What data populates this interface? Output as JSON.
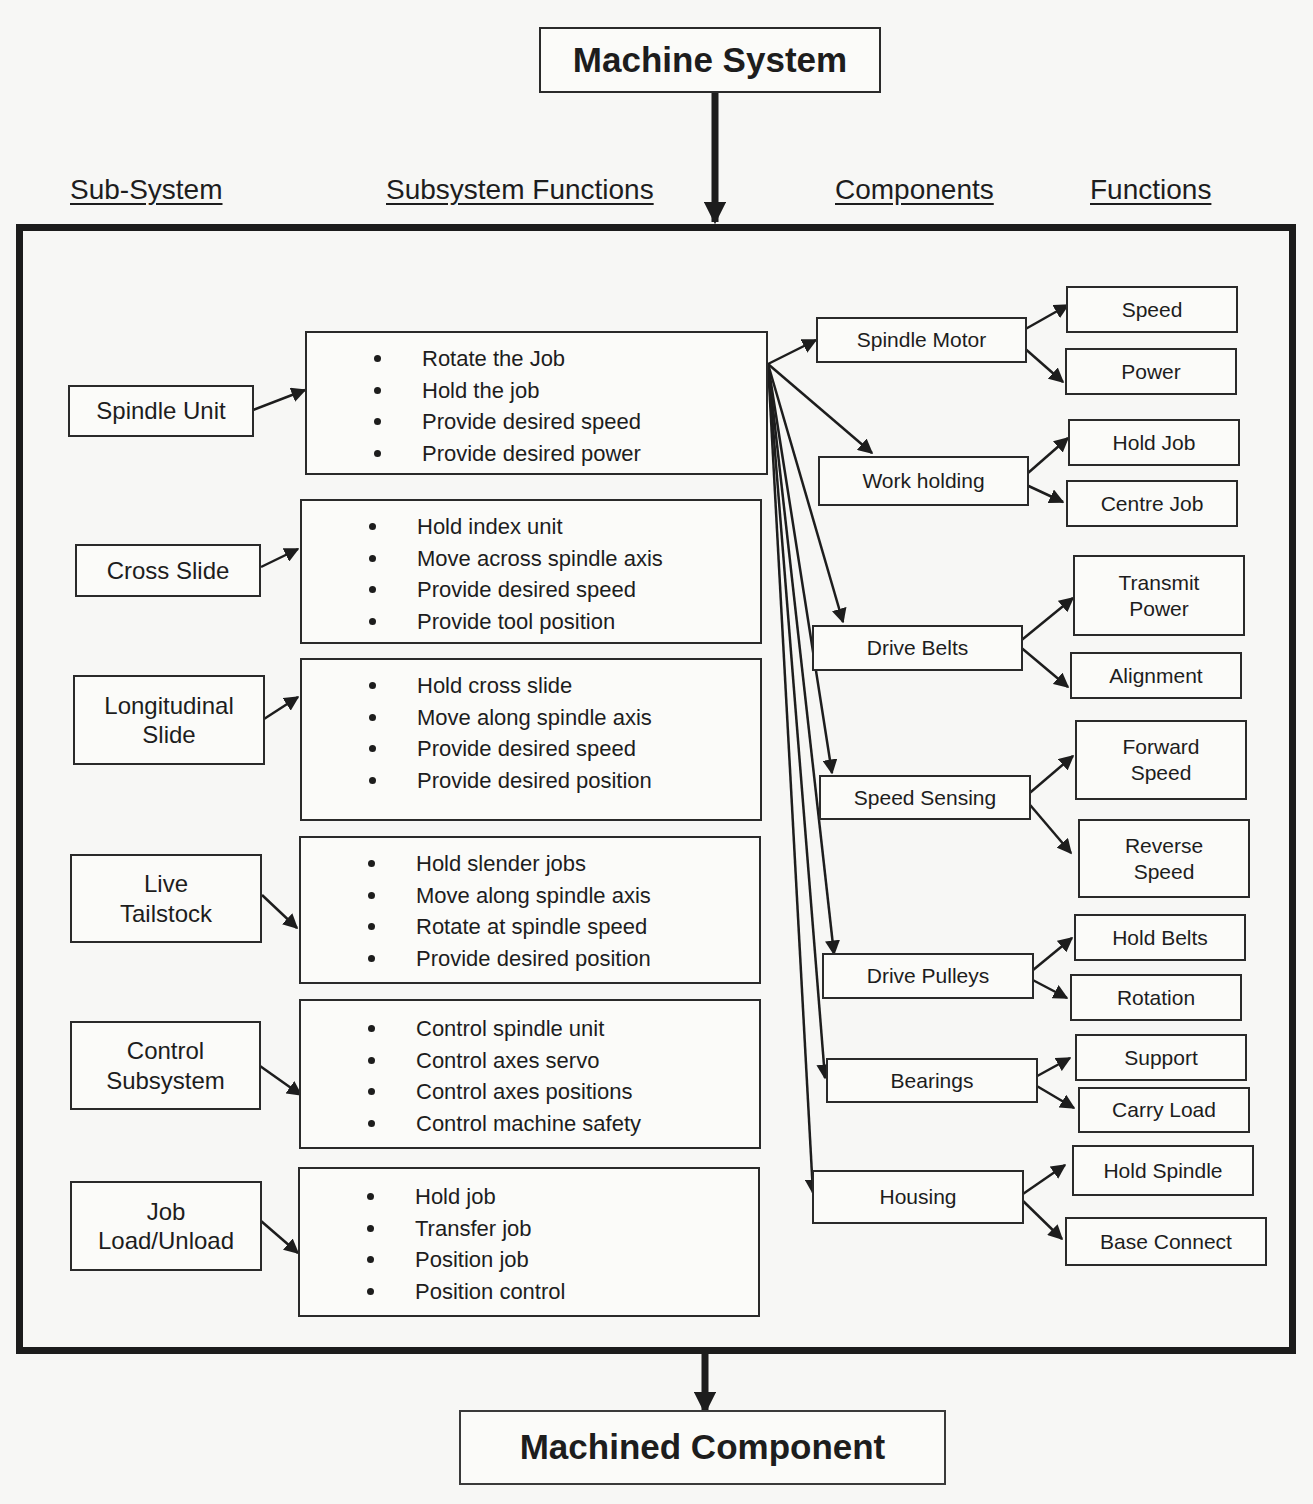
{
  "diagram": {
    "top": "Machine System",
    "bottom": "Machined Component",
    "headers": {
      "subsystem": "Sub-System",
      "subsystem_functions": "Subsystem Functions",
      "components": "Components",
      "functions": "Functions"
    },
    "subsystems": [
      {
        "label": "Spindle Unit",
        "functions": [
          "Rotate the Job",
          "Hold the job",
          "Provide desired speed",
          "Provide desired power"
        ]
      },
      {
        "label": "Cross Slide",
        "functions": [
          "Hold index unit",
          "Move across spindle axis",
          "Provide desired speed",
          "Provide tool position"
        ]
      },
      {
        "label": "Longitudinal Slide",
        "functions": [
          "Hold cross slide",
          "Move along spindle axis",
          "Provide desired speed",
          "Provide desired position"
        ]
      },
      {
        "label": "Live Tailstock",
        "functions": [
          "Hold slender jobs",
          "Move along spindle axis",
          "Rotate at spindle speed",
          "Provide desired position"
        ]
      },
      {
        "label": "Control Subsystem",
        "functions": [
          "Control spindle unit",
          "Control axes servo",
          "Control axes positions",
          "Control machine safety"
        ]
      },
      {
        "label": "Job Load/Unload",
        "functions": [
          "Hold job",
          "Transfer job",
          "Position job",
          "Position control"
        ]
      }
    ],
    "components": [
      {
        "label": "Spindle Motor",
        "functions": [
          "Speed",
          "Power"
        ]
      },
      {
        "label": "Work holding",
        "functions": [
          "Hold Job",
          "Centre Job"
        ]
      },
      {
        "label": "Drive Belts",
        "functions": [
          "Transmit Power",
          "Alignment"
        ]
      },
      {
        "label": "Speed Sensing",
        "functions": [
          "Forward Speed",
          "Reverse Speed"
        ]
      },
      {
        "label": "Drive Pulleys",
        "functions": [
          "Hold Belts",
          "Rotation"
        ]
      },
      {
        "label": "Bearings",
        "functions": [
          "Support",
          "Carry Load"
        ]
      },
      {
        "label": "Housing",
        "functions": [
          "Hold Spindle",
          "Base Connect"
        ]
      }
    ]
  }
}
